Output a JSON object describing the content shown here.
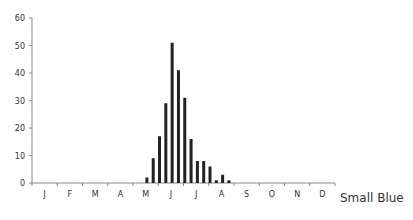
{
  "chart_data": {
    "type": "bar",
    "title": "",
    "series_name": "Small Blue",
    "xlabel": "",
    "ylabel": "",
    "ylim": [
      0,
      60
    ],
    "yticks": [
      0,
      10,
      20,
      30,
      40,
      50,
      60
    ],
    "month_labels": [
      "J",
      "F",
      "M",
      "A",
      "M",
      "J",
      "J",
      "A",
      "S",
      "O",
      "N",
      "D"
    ],
    "grid": false,
    "legend_position": "bottom-right",
    "bar_color": "#222222",
    "axis_color": "#888888",
    "bars": [
      {
        "x_month": 4.55,
        "value": 2
      },
      {
        "x_month": 4.8,
        "value": 9
      },
      {
        "x_month": 5.05,
        "value": 17
      },
      {
        "x_month": 5.3,
        "value": 29
      },
      {
        "x_month": 5.55,
        "value": 51
      },
      {
        "x_month": 5.8,
        "value": 41
      },
      {
        "x_month": 6.05,
        "value": 31
      },
      {
        "x_month": 6.3,
        "value": 16
      },
      {
        "x_month": 6.55,
        "value": 8
      },
      {
        "x_month": 6.8,
        "value": 8
      },
      {
        "x_month": 7.05,
        "value": 6
      },
      {
        "x_month": 7.3,
        "value": 1
      },
      {
        "x_month": 7.55,
        "value": 3
      },
      {
        "x_month": 7.8,
        "value": 1
      }
    ]
  }
}
